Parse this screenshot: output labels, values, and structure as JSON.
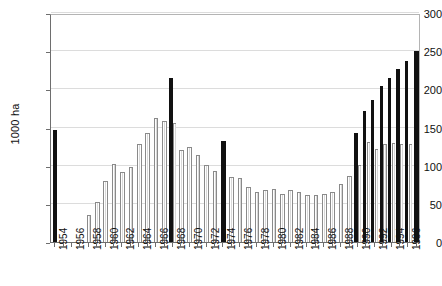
{
  "chart_data": {
    "type": "bar",
    "title": "",
    "subtitle": "",
    "xlabel": "",
    "ylabel": "1000 ha",
    "ylim": [
      0,
      300
    ],
    "yticks": [
      0,
      50,
      100,
      150,
      200,
      250,
      300
    ],
    "ytick_labels": [
      "0",
      "50",
      "100",
      "150",
      "200",
      "250",
      "300"
    ],
    "grid": true,
    "legend": "none",
    "x": [
      1954,
      1955,
      1956,
      1957,
      1958,
      1959,
      1960,
      1961,
      1962,
      1963,
      1964,
      1965,
      1966,
      1967,
      1968,
      1969,
      1970,
      1971,
      1972,
      1973,
      1974,
      1975,
      1976,
      1977,
      1978,
      1979,
      1980,
      1981,
      1982,
      1983,
      1984,
      1985,
      1986,
      1987,
      1988,
      1989,
      1990,
      1991,
      1992,
      1993,
      1994,
      1995,
      1996,
      1997
    ],
    "xtick_labels": [
      "1954",
      "1956",
      "1958",
      "1960",
      "1962",
      "1964",
      "1966",
      "1968",
      "1970",
      "1972",
      "1974",
      "1976",
      "1978",
      "1980",
      "1982",
      "1984",
      "1986",
      "1988",
      "1990",
      "1992",
      "1994",
      "1996"
    ],
    "series": [
      {
        "name": "highlighted",
        "color": "#111111",
        "values": [
          147,
          null,
          null,
          null,
          null,
          null,
          null,
          null,
          null,
          null,
          null,
          null,
          null,
          null,
          215,
          null,
          null,
          null,
          null,
          null,
          132,
          null,
          null,
          null,
          null,
          null,
          null,
          null,
          null,
          null,
          null,
          null,
          null,
          null,
          null,
          null,
          143,
          171,
          186,
          205,
          215,
          227,
          237,
          250
        ]
      },
      {
        "name": "standard",
        "color": "#ffffff",
        "values": [
          null,
          null,
          null,
          null,
          35,
          53,
          80,
          102,
          92,
          98,
          128,
          143,
          163,
          158,
          156,
          121,
          124,
          114,
          101,
          93,
          null,
          85,
          84,
          72,
          66,
          68,
          69,
          63,
          68,
          65,
          61,
          61,
          63,
          66,
          76,
          86,
          101,
          131,
          122,
          128,
          130,
          129,
          129,
          null
        ]
      }
    ]
  }
}
